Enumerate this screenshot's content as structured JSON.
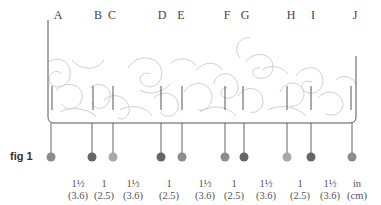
{
  "figure": {
    "label": "fig 1",
    "letters": [
      {
        "id": "A",
        "x": 58
      },
      {
        "id": "B",
        "x": 98
      },
      {
        "id": "C",
        "x": 112
      },
      {
        "id": "D",
        "x": 162
      },
      {
        "id": "E",
        "x": 181
      },
      {
        "id": "F",
        "x": 227
      },
      {
        "id": "G",
        "x": 245
      },
      {
        "id": "H",
        "x": 291
      },
      {
        "id": "I",
        "x": 313
      },
      {
        "id": "J",
        "x": 355
      }
    ],
    "pins": [
      {
        "x": 51,
        "color": "#8c8c8c"
      },
      {
        "x": 92,
        "color": "#666666"
      },
      {
        "x": 113,
        "color": "#a8a8a8"
      },
      {
        "x": 161,
        "color": "#666666"
      },
      {
        "x": 182,
        "color": "#8c8c8c"
      },
      {
        "x": 225,
        "color": "#8c8c8c"
      },
      {
        "x": 244,
        "color": "#666666"
      },
      {
        "x": 287,
        "color": "#a8a8a8"
      },
      {
        "x": 311,
        "color": "#666666"
      },
      {
        "x": 352,
        "color": "#8c8c8c"
      }
    ],
    "measurements": [
      {
        "in": "1½",
        "cm": "(3.6)",
        "x": 78
      },
      {
        "in": "1",
        "cm": "(2.5)",
        "x": 104
      },
      {
        "in": "1½",
        "cm": "(3.6)",
        "x": 133
      },
      {
        "in": "1",
        "cm": "(2.5)",
        "x": 169
      },
      {
        "in": "1½",
        "cm": "(3.6)",
        "x": 205
      },
      {
        "in": "1",
        "cm": "(2.5)",
        "x": 234
      },
      {
        "in": "1½",
        "cm": "(3.6)",
        "x": 266
      },
      {
        "in": "1",
        "cm": "(2.5)",
        "x": 300
      },
      {
        "in": "1½",
        "cm": "(3.6)",
        "x": 330
      },
      {
        "in": "in",
        "cm": "(cm)",
        "x": 356
      }
    ],
    "colors": {
      "outline": "#555555",
      "pattern": "#cfcfcf",
      "pin_dark": "#666666",
      "pin_mid": "#8c8c8c",
      "pin_light": "#a8a8a8"
    }
  }
}
